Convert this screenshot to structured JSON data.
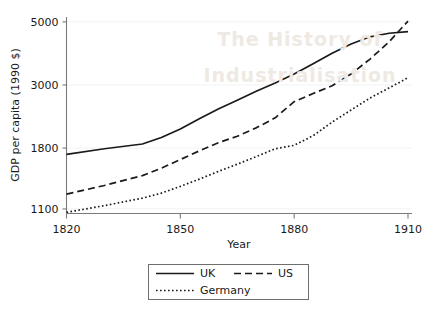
{
  "background_watermark": {
    "line1": "The History of",
    "line2": "Industrialisation"
  },
  "chart_data": {
    "type": "line",
    "title": "",
    "xlabel": "Year",
    "ylabel": "GDP per capita (1990 $)",
    "xlim": [
      1820,
      1910
    ],
    "ylim": [
      1060,
      5200
    ],
    "yscale": "log",
    "grid": "horizontal-faint",
    "legend_position": "bottom-outside",
    "xticks": [
      1820,
      1850,
      1880,
      1910
    ],
    "xtick_labels": [
      "1820",
      "1850",
      "1880",
      "1910"
    ],
    "yticks": [
      1100,
      1800,
      3000,
      5000
    ],
    "ytick_labels": [
      "1100",
      "1800",
      "3000",
      "5000"
    ],
    "series": [
      {
        "name": "UK",
        "style": "solid",
        "x": [
          1820,
          1830,
          1840,
          1845,
          1850,
          1855,
          1860,
          1865,
          1870,
          1875,
          1880,
          1885,
          1890,
          1895,
          1900,
          1905,
          1910
        ],
        "values": [
          1710,
          1790,
          1860,
          1960,
          2100,
          2280,
          2470,
          2650,
          2850,
          3050,
          3280,
          3560,
          3880,
          4180,
          4430,
          4560,
          4620
        ]
      },
      {
        "name": "US",
        "style": "dashed",
        "x": [
          1820,
          1830,
          1840,
          1845,
          1850,
          1855,
          1860,
          1865,
          1870,
          1875,
          1880,
          1885,
          1890,
          1895,
          1900,
          1905,
          1910
        ],
        "values": [
          1240,
          1330,
          1440,
          1530,
          1640,
          1760,
          1880,
          1980,
          2120,
          2300,
          2620,
          2800,
          2980,
          3280,
          3700,
          4250,
          5030
        ]
      },
      {
        "name": "Germany",
        "style": "dotted",
        "x": [
          1820,
          1830,
          1840,
          1845,
          1850,
          1855,
          1860,
          1865,
          1870,
          1875,
          1880,
          1885,
          1890,
          1895,
          1900,
          1905,
          1910
        ],
        "values": [
          1070,
          1130,
          1200,
          1250,
          1320,
          1400,
          1490,
          1580,
          1680,
          1790,
          1840,
          1990,
          2220,
          2450,
          2700,
          2930,
          3180
        ]
      }
    ],
    "legend_entries": [
      "UK",
      "US",
      "Germany"
    ]
  }
}
